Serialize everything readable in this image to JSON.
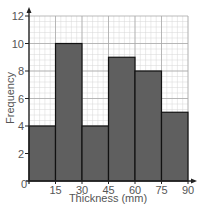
{
  "chart_data": {
    "type": "bar",
    "subtype": "histogram",
    "title": "",
    "xlabel": "Thickness (mm)",
    "ylabel": "Frequency",
    "x_ticks": [
      0,
      15,
      30,
      45,
      60,
      75,
      90
    ],
    "y_ticks": [
      0,
      2,
      4,
      6,
      8,
      10,
      12
    ],
    "xlim": [
      0,
      90
    ],
    "ylim": [
      0,
      12
    ],
    "grid": true,
    "categories": [
      "0-15",
      "15-30",
      "30-45",
      "45-60",
      "60-75",
      "75-90"
    ],
    "bins": [
      [
        0,
        15
      ],
      [
        15,
        30
      ],
      [
        30,
        45
      ],
      [
        45,
        60
      ],
      [
        60,
        75
      ],
      [
        75,
        90
      ]
    ],
    "values": [
      4,
      10,
      4,
      9,
      8,
      5
    ],
    "colors": {
      "bar_fill": "#5f5f5f",
      "bar_edge": "#111111",
      "grid_major": "#aaaaaa",
      "grid_minor": "#d6d6d6",
      "axis": "#222222",
      "text": "#555555"
    }
  },
  "labels": {
    "xlabel": "Thickness (mm)",
    "ylabel": "Frequency",
    "x_ticks": [
      "0",
      "15",
      "30",
      "45",
      "60",
      "75",
      "90"
    ],
    "y_ticks": [
      "0",
      "2",
      "4",
      "6",
      "8",
      "10",
      "12"
    ]
  }
}
